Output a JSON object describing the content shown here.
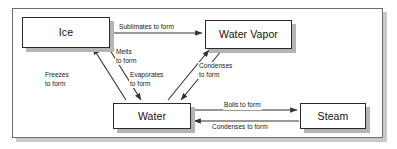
{
  "diagram": {
    "frame": {
      "border_color": "#6e6e6e",
      "shadow_color": "#c9c9c9",
      "background": "#ffffff"
    },
    "nodes": [
      {
        "id": "ice",
        "label": "Ice"
      },
      {
        "id": "vapor",
        "label": "Water Vapor"
      },
      {
        "id": "water",
        "label": "Water"
      },
      {
        "id": "steam",
        "label": "Steam"
      }
    ],
    "edges": [
      {
        "id": "sublimates",
        "from": "ice",
        "to": "vapor",
        "label": "Sublimates to form",
        "line1": "Sublimates to form",
        "line2": ""
      },
      {
        "id": "melts",
        "from": "ice",
        "to": "water",
        "label": "Melts to form",
        "line1": "Melts",
        "line2": "to form"
      },
      {
        "id": "freezes",
        "from": "water",
        "to": "ice",
        "label": "Freezes to form",
        "line1": "Freezes",
        "line2": "to form"
      },
      {
        "id": "evaporates",
        "from": "water",
        "to": "vapor",
        "label": "Evaporates to form",
        "line1": "Evaporates",
        "line2": "to form"
      },
      {
        "id": "condenses-vapor",
        "from": "vapor",
        "to": "water",
        "label": "Condenses to form",
        "line1": "Condenses",
        "line2": "to form"
      },
      {
        "id": "boils",
        "from": "water",
        "to": "steam",
        "label": "Boils to form",
        "line1": "Boils to form",
        "line2": ""
      },
      {
        "id": "condenses-steam",
        "from": "steam",
        "to": "water",
        "label": "Condenses to form",
        "line1": "Condenses to form",
        "line2": ""
      }
    ],
    "colors": {
      "node_border": "#2b2b2b",
      "node_fill": "#ffffff",
      "node_shadow": "#b4b4b4",
      "arrow": "#333333",
      "text": "#111111"
    }
  }
}
